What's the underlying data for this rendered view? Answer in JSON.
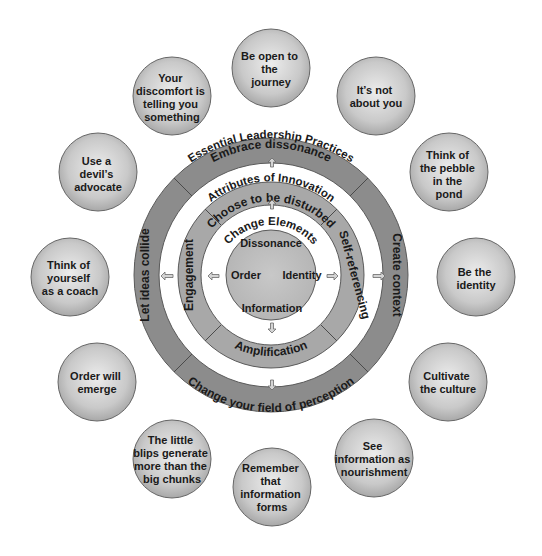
{
  "diagram": {
    "outer_ring_title": "Essential Leadership Practices",
    "outer_ring": {
      "top": "Embrace dissonance",
      "right": "Create context",
      "bottom": "Change your field of perception",
      "left": "Let ideas collide"
    },
    "middle_ring_title": "Attributes of Innovation",
    "middle_ring": {
      "top": "Choose to be disturbed",
      "right": "Self-referencing",
      "bottom": "Amplification",
      "left": "Engagement"
    },
    "core_title": "Change Elements",
    "core": {
      "top": "Dissonance",
      "right": "Identity",
      "bottom": "Information",
      "left": "Order"
    },
    "satellites": [
      {
        "lines": [
          "Be open to",
          "the",
          "journey"
        ]
      },
      {
        "lines": [
          "It’s not",
          "about you"
        ]
      },
      {
        "lines": [
          "Think of",
          "the pebble",
          "in the",
          "pond"
        ]
      },
      {
        "lines": [
          "Be the",
          "identity"
        ]
      },
      {
        "lines": [
          "Cultivate",
          "the culture"
        ]
      },
      {
        "lines": [
          "See",
          "information as",
          "nourishment"
        ]
      },
      {
        "lines": [
          "Remember",
          "that",
          "information",
          "forms"
        ]
      },
      {
        "lines": [
          "The little",
          "blips generate",
          "more than the",
          "big chunks"
        ]
      },
      {
        "lines": [
          "Order will",
          "emerge"
        ]
      },
      {
        "lines": [
          "Think of",
          "yourself",
          "as a coach"
        ]
      },
      {
        "lines": [
          "Use a",
          "devil’s",
          "advocate"
        ]
      },
      {
        "lines": [
          "Your",
          "discomfort is",
          "telling you",
          "something"
        ]
      }
    ],
    "colors": {
      "outer_ring_fill": "#8c8c8c",
      "middle_ring_fill": "#a8a8a8",
      "core_fill": "#bcbcbc",
      "satellite_fill_light": "#e6e6e6",
      "satellite_fill_dark": "#a6a6a6",
      "stroke": "#555555",
      "arrow_fill": "#d0d0d0"
    }
  }
}
